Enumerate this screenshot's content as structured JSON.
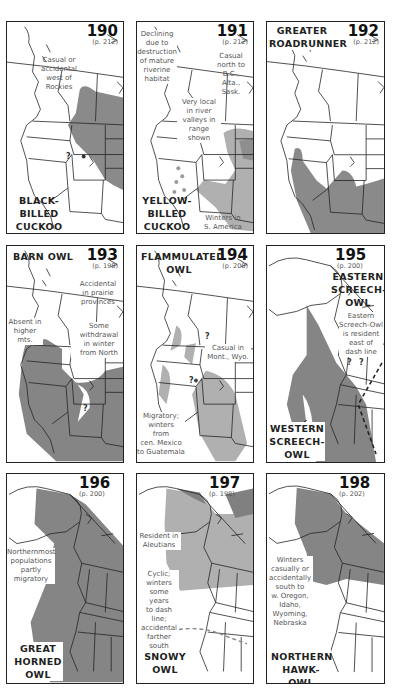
{
  "colors": {
    "range_dark": "#858585",
    "range_light": "#b4b4b4",
    "border": "#222222",
    "text_note": "#555555"
  },
  "panels": [
    {
      "number": "190",
      "page": "(p. 212)",
      "species": [
        "BLACK-",
        "BILLED",
        "CUCKOO"
      ],
      "notes": [
        "Casual or",
        "accidental",
        "west of",
        "Rockies"
      ]
    },
    {
      "number": "191",
      "page": "(p. 212)",
      "species": [
        "YELLOW-",
        "BILLED",
        "CUCKOO"
      ],
      "notes": {
        "declining": [
          "Declining",
          "due to",
          "destruction",
          "of mature",
          "riverine",
          "habitat"
        ],
        "casual": [
          "Casual",
          "north to",
          "B.C.,",
          "Alta.,",
          "Sask."
        ],
        "local": [
          "Very local",
          "in river",
          "valleys in",
          "range shown"
        ],
        "winters": [
          "Winters in",
          "S. America"
        ]
      }
    },
    {
      "number": "192",
      "page": "(p. 212)",
      "species": [
        "GREATER",
        "ROADRUNNER"
      ]
    },
    {
      "number": "193",
      "page": "(p. 198)",
      "species": [
        "BARN OWL"
      ],
      "notes": {
        "accidental": [
          "Accidental",
          "in prairie",
          "provinces"
        ],
        "absent": [
          "Absent in",
          "higher",
          "mts."
        ],
        "withdrawal": [
          "Some withdrawal",
          "in winter",
          "from North"
        ]
      }
    },
    {
      "number": "194",
      "page": "(p. 200)",
      "species": [
        "FLAMMULATED",
        "OWL"
      ],
      "notes": {
        "casual": [
          "Casual in",
          "Mont., Wyo."
        ],
        "migratory": [
          "Migratory;",
          "winters",
          "from",
          "cen. Mexico",
          "to Guatemala"
        ]
      }
    },
    {
      "number": "195",
      "page": "(p. 200)",
      "species_east": [
        "EASTERN",
        "SCREECH-",
        "OWL"
      ],
      "species_west": [
        "WESTERN",
        "SCREECH-",
        "OWL"
      ],
      "notes": [
        "Eastern",
        "Screech-Owl",
        "is resident",
        "east of",
        "dash line"
      ]
    },
    {
      "number": "196",
      "page": "(p. 200)",
      "species": [
        "GREAT",
        "HORNED",
        "OWL"
      ],
      "notes": [
        "Northernmost",
        "populations",
        "partly",
        "migratory"
      ]
    },
    {
      "number": "197",
      "page": "(p. 198)",
      "species": [
        "SNOWY",
        "OWL"
      ],
      "notes": {
        "aleutians": [
          "Resident in",
          "Aleutians"
        ],
        "cyclic": [
          "Cyclic;",
          "winters",
          "some years",
          "to dash",
          "line;",
          "accidental",
          "farther",
          "south"
        ]
      }
    },
    {
      "number": "198",
      "page": "(p. 202)",
      "species": [
        "NORTHERN",
        "HAWK-OWL"
      ],
      "notes": [
        "Winters",
        "casually or",
        "accidentally",
        "south to",
        "w. Oregon,",
        "Idaho,",
        "Wyoming,",
        "Nebraska"
      ]
    }
  ],
  "question_mark": "?"
}
